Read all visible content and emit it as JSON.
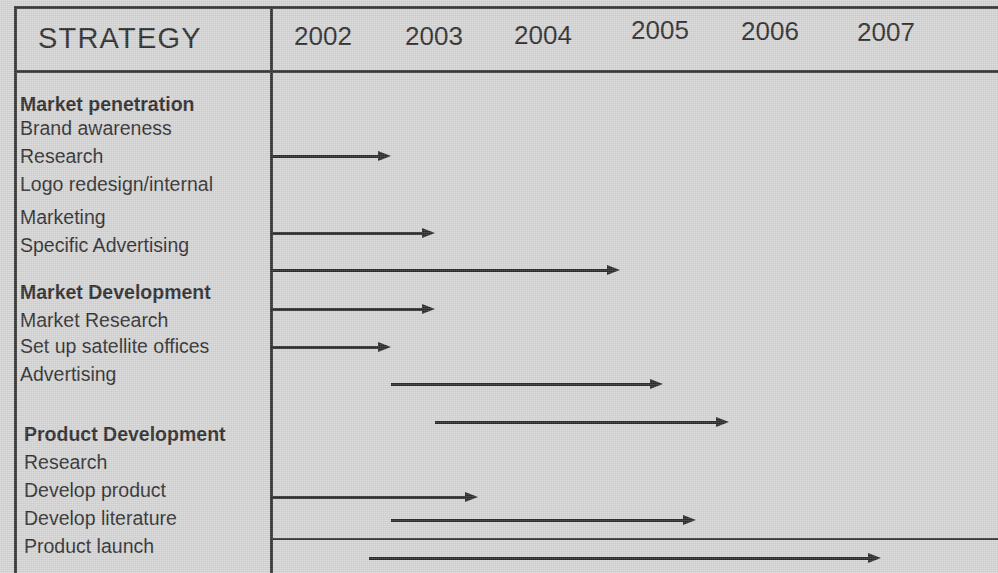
{
  "chart_data": {
    "type": "gantt",
    "title": "STRATEGY",
    "xlabel": "",
    "ylabel": "",
    "grid": false,
    "legend": "none",
    "axis_years": [
      "2002",
      "2003",
      "2004",
      "2005",
      "2006",
      "2007"
    ],
    "xlim": [
      2002,
      2008
    ],
    "groups": [
      {
        "name": "Market penetration",
        "tasks": [
          "Brand awareness",
          "Research",
          "Logo redesign/internal",
          "Marketing",
          "Specific Advertising"
        ]
      },
      {
        "name": "Market Development",
        "tasks": [
          "Market Research",
          "Set up satellite offices",
          "Advertising"
        ]
      },
      {
        "name": "Product Development",
        "tasks": [
          "Research",
          "Develop product",
          "Develop literature",
          "Product launch"
        ]
      }
    ],
    "bars": [
      {
        "task": "Brand awareness",
        "start_year": 2002.0,
        "end_year": 2003.1
      },
      {
        "task": "Logo redesign/internal",
        "start_year": 2002.0,
        "end_year": 2003.5
      },
      {
        "task": "Marketing",
        "start_year": 2002.0,
        "end_year": 2005.2
      },
      {
        "task": "Market Research",
        "start_year": 2002.0,
        "end_year": 2003.5
      },
      {
        "task": "Set up satellite offices",
        "start_year": 2002.0,
        "end_year": 2003.1
      },
      {
        "task": "Advertising",
        "start_year": 2003.1,
        "end_year": 2005.6
      },
      {
        "task": "Product Development",
        "start_year": 2003.5,
        "end_year": 2006.2
      },
      {
        "task": "Develop product",
        "start_year": 2002.0,
        "end_year": 2003.9
      },
      {
        "task": "Develop literature",
        "start_year": 2003.1,
        "end_year": 2005.9
      },
      {
        "task": "Product launch",
        "start_year": 2002.9,
        "end_year": 2007.6
      }
    ]
  },
  "header": {
    "strategy_title": "STRATEGY",
    "years": [
      {
        "label": "2002"
      },
      {
        "label": "2003"
      },
      {
        "label": "2004"
      },
      {
        "label": "2005"
      },
      {
        "label": "2006"
      },
      {
        "label": "2007"
      }
    ]
  },
  "rows": [
    {
      "label": "Market penetration",
      "bold": true
    },
    {
      "label": "Brand awareness",
      "bold": false
    },
    {
      "label": "Research",
      "bold": false
    },
    {
      "label": "Logo redesign/internal",
      "bold": false
    },
    {
      "label": "Marketing",
      "bold": false
    },
    {
      "label": "Specific Advertising",
      "bold": false
    },
    {
      "label": "Market Development",
      "bold": true
    },
    {
      "label": "Market Research",
      "bold": false
    },
    {
      "label": "Set up satellite offices",
      "bold": false
    },
    {
      "label": "Advertising",
      "bold": false
    },
    {
      "label": "Product Development",
      "bold": true
    },
    {
      "label": "Research",
      "bold": false
    },
    {
      "label": "Develop product",
      "bold": false
    },
    {
      "label": "Develop literature",
      "bold": false
    },
    {
      "label": "Product launch",
      "bold": false
    }
  ],
  "colors": {
    "background": "#d2d2d2",
    "ink": "#1d1d1d",
    "rule": "#262626",
    "arrow": "#1a1a1a"
  }
}
